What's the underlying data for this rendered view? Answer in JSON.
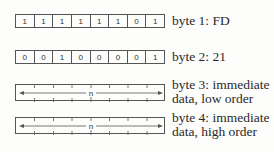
{
  "bytes": [
    {
      "bits": [
        "1",
        "1",
        "1",
        "1",
        "1",
        "1",
        "0",
        "1"
      ],
      "label": "byte 1: FD"
    },
    {
      "bits": [
        "0",
        "0",
        "1",
        "0",
        "0",
        "0",
        "0",
        "1"
      ],
      "label": "byte 2: 21"
    },
    {
      "field": "n",
      "label_line1": "byte 3: immediate",
      "label_line2": "data, low order"
    },
    {
      "field": "n",
      "label_line1": "byte 4: immediate",
      "label_line2": "data, high order"
    }
  ]
}
